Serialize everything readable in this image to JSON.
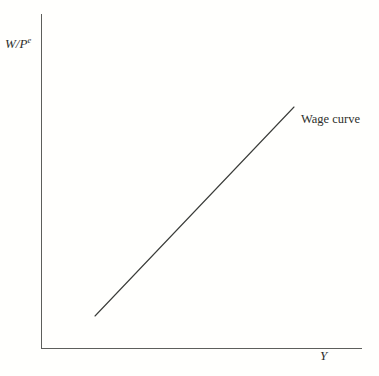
{
  "figure": {
    "background_color": "#fffffd",
    "ink_color": "#2e2f2c",
    "axis_color": "#5d5f5c"
  },
  "axes": {
    "y_label_main": "W/P",
    "y_label_superscript": "e",
    "x_label": "Y"
  },
  "annotations": {
    "wage_curve_label": "Wage curve"
  },
  "chart_data": {
    "type": "line",
    "title": "",
    "subtitle": "",
    "xlabel": "Y",
    "ylabel": "W/Pᵉ",
    "grid": false,
    "legend_position": "inline-annotation",
    "xlim": [
      0,
      100
    ],
    "ylim": [
      0,
      100
    ],
    "axis_ticks": {
      "x": [],
      "y": []
    },
    "series": [
      {
        "name": "Wage curve",
        "type": "line",
        "style": "straight-upward-sloping",
        "color": "#3a3c39",
        "x": [
          16.8,
          78.8
        ],
        "y": [
          9.6,
          72.1
        ],
        "pixel_endpoints": [
          [
            95,
            316
          ],
          [
            294,
            107
          ]
        ],
        "annotation": "Wage curve"
      }
    ]
  }
}
